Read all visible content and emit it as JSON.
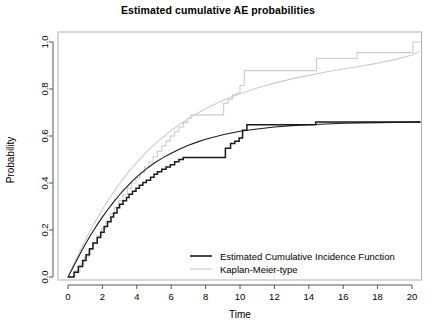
{
  "chart_data": {
    "type": "line",
    "title": "Estimated cumulative AE probabilities",
    "xlabel": "Time",
    "ylabel": "Probability",
    "xlim": [
      0,
      20.8
    ],
    "ylim": [
      0,
      1.04
    ],
    "xticks": [
      0,
      2,
      4,
      6,
      8,
      10,
      12,
      14,
      16,
      18,
      20
    ],
    "xtick_labels": [
      "0",
      "2",
      "4",
      "6",
      "8",
      "10",
      "12",
      "14",
      "16",
      "18",
      "20"
    ],
    "yticks": [
      0.0,
      0.2,
      0.4,
      0.6,
      0.8,
      1.0
    ],
    "ytick_labels": [
      "0.0",
      "0.2",
      "0.4",
      "0.6",
      "0.8",
      "1.0"
    ],
    "grid": false,
    "frame": true,
    "legend_position": "bottom-right",
    "colors": {
      "cif": "#1a1a1a",
      "km": "#cccccc",
      "frame": "#b0b0b0",
      "axis": "#555555"
    },
    "series": [
      {
        "name": "Estimated Cumulative Incidence Function",
        "style": "step-and-smooth",
        "color": "#1a1a1a",
        "smooth": [
          [
            0.0,
            0.0
          ],
          [
            0.25,
            0.035
          ],
          [
            0.5,
            0.07
          ],
          [
            0.75,
            0.105
          ],
          [
            1.0,
            0.138
          ],
          [
            1.25,
            0.17
          ],
          [
            1.5,
            0.2
          ],
          [
            1.75,
            0.228
          ],
          [
            2.0,
            0.255
          ],
          [
            2.25,
            0.281
          ],
          [
            2.5,
            0.305
          ],
          [
            2.75,
            0.328
          ],
          [
            3.0,
            0.35
          ],
          [
            3.25,
            0.371
          ],
          [
            3.5,
            0.39
          ],
          [
            3.75,
            0.409
          ],
          [
            4.0,
            0.426
          ],
          [
            4.5,
            0.457
          ],
          [
            5.0,
            0.484
          ],
          [
            5.5,
            0.507
          ],
          [
            6.0,
            0.527
          ],
          [
            6.5,
            0.545
          ],
          [
            7.0,
            0.561
          ],
          [
            7.5,
            0.574
          ],
          [
            8.0,
            0.586
          ],
          [
            8.5,
            0.596
          ],
          [
            9.0,
            0.605
          ],
          [
            9.5,
            0.613
          ],
          [
            10.0,
            0.62
          ],
          [
            11.0,
            0.63
          ],
          [
            12.0,
            0.638
          ],
          [
            13.0,
            0.644
          ],
          [
            14.0,
            0.648
          ],
          [
            15.0,
            0.651
          ],
          [
            16.0,
            0.654
          ],
          [
            17.0,
            0.656
          ],
          [
            18.0,
            0.657
          ],
          [
            19.0,
            0.658
          ],
          [
            20.0,
            0.659
          ],
          [
            20.6,
            0.659
          ]
        ],
        "steps": [
          [
            0.0,
            0.0
          ],
          [
            0.35,
            0.02
          ],
          [
            0.6,
            0.045
          ],
          [
            0.85,
            0.07
          ],
          [
            1.05,
            0.095
          ],
          [
            1.25,
            0.12
          ],
          [
            1.45,
            0.145
          ],
          [
            1.7,
            0.168
          ],
          [
            1.9,
            0.19
          ],
          [
            2.1,
            0.215
          ],
          [
            2.3,
            0.235
          ],
          [
            2.5,
            0.255
          ],
          [
            2.65,
            0.272
          ],
          [
            2.85,
            0.295
          ],
          [
            3.0,
            0.31
          ],
          [
            3.2,
            0.325
          ],
          [
            3.4,
            0.338
          ],
          [
            3.55,
            0.352
          ],
          [
            3.75,
            0.365
          ],
          [
            3.95,
            0.378
          ],
          [
            4.15,
            0.39
          ],
          [
            4.35,
            0.402
          ],
          [
            4.55,
            0.412
          ],
          [
            4.8,
            0.425
          ],
          [
            5.0,
            0.437
          ],
          [
            5.2,
            0.448
          ],
          [
            5.45,
            0.458
          ],
          [
            5.7,
            0.468
          ],
          [
            5.95,
            0.478
          ],
          [
            6.2,
            0.49
          ],
          [
            6.45,
            0.5
          ],
          [
            6.7,
            0.508
          ],
          [
            9.05,
            0.508
          ],
          [
            9.15,
            0.548
          ],
          [
            9.45,
            0.568
          ],
          [
            9.7,
            0.578
          ],
          [
            9.95,
            0.592
          ],
          [
            10.15,
            0.625
          ],
          [
            10.4,
            0.648
          ],
          [
            14.2,
            0.648
          ],
          [
            14.4,
            0.66
          ],
          [
            20.6,
            0.66
          ]
        ]
      },
      {
        "name": "Kaplan-Meier-type",
        "style": "step-and-smooth",
        "color": "#cccccc",
        "smooth": [
          [
            0.0,
            0.0
          ],
          [
            0.25,
            0.04
          ],
          [
            0.5,
            0.08
          ],
          [
            0.75,
            0.118
          ],
          [
            1.0,
            0.155
          ],
          [
            1.25,
            0.19
          ],
          [
            1.5,
            0.224
          ],
          [
            1.75,
            0.256
          ],
          [
            2.0,
            0.287
          ],
          [
            2.25,
            0.317
          ],
          [
            2.5,
            0.345
          ],
          [
            2.75,
            0.372
          ],
          [
            3.0,
            0.398
          ],
          [
            3.25,
            0.422
          ],
          [
            3.5,
            0.445
          ],
          [
            3.75,
            0.467
          ],
          [
            4.0,
            0.488
          ],
          [
            4.5,
            0.527
          ],
          [
            5.0,
            0.562
          ],
          [
            5.5,
            0.594
          ],
          [
            6.0,
            0.623
          ],
          [
            6.5,
            0.65
          ],
          [
            7.0,
            0.674
          ],
          [
            7.5,
            0.696
          ],
          [
            8.0,
            0.716
          ],
          [
            8.5,
            0.734
          ],
          [
            9.0,
            0.751
          ],
          [
            9.5,
            0.766
          ],
          [
            10.0,
            0.78
          ],
          [
            11.0,
            0.804
          ],
          [
            12.0,
            0.825
          ],
          [
            13.0,
            0.843
          ],
          [
            14.0,
            0.858
          ],
          [
            15.0,
            0.872
          ],
          [
            16.0,
            0.885
          ],
          [
            17.0,
            0.897
          ],
          [
            18.0,
            0.91
          ],
          [
            19.0,
            0.925
          ],
          [
            20.0,
            0.945
          ],
          [
            20.4,
            0.96
          ]
        ],
        "steps": [
          [
            0.0,
            0.0
          ],
          [
            0.4,
            0.025
          ],
          [
            0.7,
            0.055
          ],
          [
            0.95,
            0.085
          ],
          [
            1.2,
            0.115
          ],
          [
            1.45,
            0.145
          ],
          [
            1.7,
            0.175
          ],
          [
            1.95,
            0.205
          ],
          [
            2.2,
            0.238
          ],
          [
            2.45,
            0.268
          ],
          [
            2.7,
            0.295
          ],
          [
            2.95,
            0.325
          ],
          [
            3.2,
            0.352
          ],
          [
            3.45,
            0.378
          ],
          [
            3.7,
            0.4
          ],
          [
            3.95,
            0.422
          ],
          [
            4.2,
            0.445
          ],
          [
            4.45,
            0.468
          ],
          [
            4.7,
            0.49
          ],
          [
            4.95,
            0.512
          ],
          [
            5.2,
            0.535
          ],
          [
            5.45,
            0.558
          ],
          [
            5.7,
            0.578
          ],
          [
            5.95,
            0.6
          ],
          [
            6.2,
            0.618
          ],
          [
            6.45,
            0.638
          ],
          [
            6.7,
            0.658
          ],
          [
            6.95,
            0.675
          ],
          [
            7.15,
            0.69
          ],
          [
            8.95,
            0.69
          ],
          [
            9.05,
            0.74
          ],
          [
            9.3,
            0.755
          ],
          [
            9.55,
            0.775
          ],
          [
            9.8,
            0.782
          ],
          [
            10.0,
            0.815
          ],
          [
            10.25,
            0.878
          ],
          [
            14.2,
            0.878
          ],
          [
            14.45,
            0.93
          ],
          [
            16.6,
            0.93
          ],
          [
            16.8,
            0.955
          ],
          [
            19.9,
            0.955
          ],
          [
            20.05,
            1.0
          ],
          [
            20.6,
            1.0
          ]
        ]
      }
    ],
    "legend": [
      {
        "label": "Estimated Cumulative Incidence Function",
        "color": "#1a1a1a"
      },
      {
        "label": "Kaplan-Meier-type",
        "color": "#cccccc"
      }
    ]
  }
}
